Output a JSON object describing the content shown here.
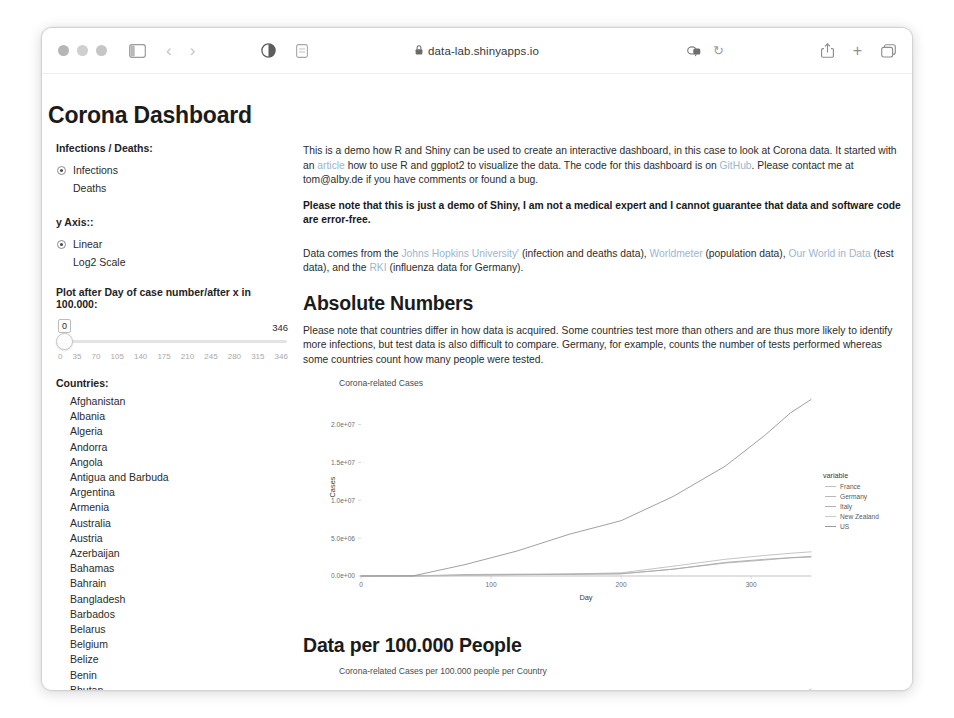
{
  "browser": {
    "url": "data-lab.shinyapps.io",
    "lock_icon": "lock-icon",
    "traffic_lights": [
      "close-button",
      "minimize-button",
      "maximize-button"
    ],
    "sidebar_toggle_icon": "sidebar-toggle-icon",
    "back_arrow": "‹",
    "forward_arrow": "›",
    "reader_icon": "reader-view-icon",
    "contrast_icon": "contrast-icon",
    "shield_icon": "privacy-report-icon",
    "reload_icon": "↻",
    "share_icon": "share-icon",
    "new_tab_icon": "+",
    "tabs_icon": "show-tabs-icon"
  },
  "page": {
    "title": "Corona Dashboard"
  },
  "sidebar": {
    "infection_group_label": "Infections / Deaths:",
    "infection_options": [
      {
        "label": "Infections",
        "selected": true
      },
      {
        "label": "Deaths",
        "selected": false
      }
    ],
    "yaxis_group_label": "y Axis::",
    "yaxis_options": [
      {
        "label": "Linear",
        "selected": true
      },
      {
        "label": "Log2 Scale",
        "selected": false
      }
    ],
    "slider_label": "Plot after Day of case number/after x in 100.000:",
    "slider_value": "0",
    "slider_max_label": "346",
    "slider_ticks": [
      "0",
      "35",
      "70",
      "105",
      "140",
      "175",
      "210",
      "245",
      "280",
      "315",
      "346"
    ],
    "countries_label": "Countries:",
    "countries": [
      "Afghanistan",
      "Albania",
      "Algeria",
      "Andorra",
      "Angola",
      "Antigua and Barbuda",
      "Argentina",
      "Armenia",
      "Australia",
      "Austria",
      "Azerbaijan",
      "Bahamas",
      "Bahrain",
      "Bangladesh",
      "Barbados",
      "Belarus",
      "Belgium",
      "Belize",
      "Benin",
      "Bhutan",
      "Bolivia",
      "Bosnia and Herzegovina",
      "Botswana",
      "Brazil"
    ]
  },
  "main": {
    "intro_part1": "This is a demo how R and Shiny can be used to create an interactive dashboard, in this case to look at Corona data. It started with an ",
    "intro_link_article": "article",
    "intro_part2": " how to use R and ggplot2 to visualize the data. The code for this dashboard is on ",
    "intro_link_github": "GitHub",
    "intro_part3": ". Please contact me at tom@alby.de if you have comments or found a bug.",
    "disclaimer": "Please note that this is just a demo of Shiny, I am not a medical expert and I cannot guarantee that data and software code are error-free.",
    "sources_part1": "Data comes from the ",
    "sources_link_jhu": "Johns Hopkins University'",
    "sources_part2": " (infection and deaths data), ",
    "sources_link_worldometer": "Worldmeter",
    "sources_part3": " (population data), ",
    "sources_link_owid": "Our World in Data",
    "sources_part4": " (test data), and the ",
    "sources_link_rki": "RKI",
    "sources_part5": " (influenza data for Germany).",
    "section1_heading": "Absolute Numbers",
    "section1_note": "Please note that countries differ in how data is acquired. Some countries test more than others and are thus more likely to identify more infections, but test data is also difficult to compare. Germany, for example, counts the number of tests performed whereas some countries count how many people were tested.",
    "section2_heading": "Data per 100.000 People"
  },
  "chart_data": [
    {
      "type": "line",
      "title": "Corona-related Cases",
      "xlabel": "Day",
      "ylabel": "Cases",
      "xticks": [
        "0",
        "100",
        "200",
        "300"
      ],
      "xtickvals": [
        0,
        100,
        200,
        300
      ],
      "yticks": [
        "0.0e+00",
        "5.0e+06",
        "1.0e+07",
        "1.5e+07",
        "2.0e+07"
      ],
      "ytickvals": [
        0,
        5000000,
        10000000,
        15000000,
        20000000
      ],
      "xlim": [
        0,
        346
      ],
      "ylim": [
        0,
        23500000
      ],
      "grid": false,
      "legend_title": "variable",
      "legend_position": "right",
      "x": [
        0,
        40,
        80,
        120,
        160,
        200,
        240,
        280,
        310,
        330,
        346
      ],
      "series": [
        {
          "name": "France",
          "color": "#b9b9b9",
          "values": [
            0,
            1000,
            60000,
            160000,
            260000,
            420000,
            1300000,
            2200000,
            2700000,
            3000000,
            3200000
          ]
        },
        {
          "name": "Germany",
          "color": "#b0b0b0",
          "values": [
            0,
            1000,
            80000,
            180000,
            210000,
            280000,
            900000,
            1700000,
            2100000,
            2400000,
            2600000
          ]
        },
        {
          "name": "Italy",
          "color": "#a8a8a8",
          "values": [
            0,
            2000,
            200000,
            240000,
            250000,
            310000,
            900000,
            1800000,
            2200000,
            2400000,
            2500000
          ]
        },
        {
          "name": "New Zealand",
          "color": "#c6c6c6",
          "values": [
            0,
            100,
            1200,
            1500,
            1600,
            1800,
            1900,
            2100,
            2200,
            2300,
            2400
          ]
        },
        {
          "name": "US",
          "color": "#8f8f8f",
          "values": [
            0,
            10000,
            1500000,
            3300000,
            5500000,
            7300000,
            10500000,
            14500000,
            18500000,
            21500000,
            23300000
          ]
        }
      ]
    },
    {
      "type": "line",
      "title": "Corona-related Cases per 100.000 people per Country",
      "xlabel": "Day",
      "ylabel": "per 100.000",
      "yticks": [
        "4000",
        "6000"
      ],
      "ytickvals": [
        4000,
        6000
      ],
      "ylim": [
        0,
        7200
      ],
      "xlim": [
        0,
        346
      ],
      "grid": false,
      "legend_title": "variable",
      "legend_position": "right",
      "legend_visible_entries": [
        "France",
        "Germany"
      ],
      "x": [
        0,
        200,
        240,
        280,
        310,
        330,
        346
      ],
      "series": [
        {
          "name": "France",
          "color": "#b9b9b9",
          "values": [
            0,
            300,
            1800,
            3600,
            5200,
            6200,
            7000
          ]
        },
        {
          "name": "Germany",
          "color": "#b0b0b0",
          "values": [
            0,
            200,
            900,
            1800,
            2500,
            2900,
            3200
          ]
        },
        {
          "name": "Italy",
          "color": "#a8a8a8",
          "values": [
            0,
            150,
            500,
            1100,
            1600,
            1900,
            2100
          ]
        }
      ]
    }
  ]
}
